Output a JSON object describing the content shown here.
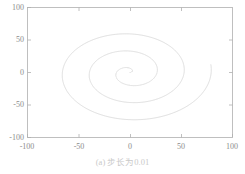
{
  "figure": {
    "caption": "(a) 步长为0.01",
    "background_color": "#ffffff",
    "axis_color": "#b0b0b0",
    "curve_color": "#d2d2d2",
    "tick_label_color": "#8c8c8c",
    "caption_color": "#c9c9c9"
  },
  "chart_data": {
    "type": "line",
    "title": "",
    "subtitle": "",
    "xlabel": "",
    "ylabel": "",
    "xlim": [
      -100,
      100
    ],
    "ylim": [
      -100,
      100
    ],
    "xticks": [
      -100,
      -50,
      0,
      50,
      100
    ],
    "yticks": [
      -100,
      -50,
      0,
      50,
      100
    ],
    "xtick_labels": [
      "-100",
      "-50",
      "0",
      "50",
      "100"
    ],
    "ytick_labels": [
      "-100",
      "-50",
      "0",
      "50",
      "100"
    ],
    "grid": false,
    "legend": null,
    "legend_position": "none",
    "annotations": [
      "(a) 步长为0.01"
    ],
    "series": [
      {
        "name": "spiral",
        "parametric": true,
        "equation": "x = 4.2*t*cos(t), y = 4.2*t*sin(t)",
        "t_range": [
          0,
          19.0
        ],
        "t_step": 0.01,
        "radius_coefficient": 4.2,
        "turns": 3.02,
        "max_radius": 80,
        "x": [
          0.0,
          -1.7,
          -5.3,
          -2.9,
          7.2,
          17.4,
          14.3,
          -4.2,
          -24.6,
          -31.0,
          -16.1,
          12.7,
          38.4,
          45.8,
          29.5,
          -4.2,
          -39.5,
          -56.7,
          -45.7,
          -11.6,
          31.1,
          61.9,
          64.0,
          35.8,
          -10.0,
          -54.9,
          -77.8,
          -68.1,
          -28.6,
          25.9,
          71.0,
          80.0
        ],
        "y": [
          0.0,
          2.6,
          1.4,
          -4.4,
          -7.3,
          -0.3,
          12.4,
          20.9,
          17.1,
          -0.4,
          -22.9,
          -36.7,
          -32.4,
          -9.3,
          21.8,
          45.6,
          46.5,
          23.1,
          -15.2,
          -50.9,
          -62.6,
          -44.5,
          -3.7,
          41.0,
          67.7,
          63.2,
          26.4,
          -24.6,
          -69.0,
          -83.0,
          -59.7,
          -9.2
        ]
      }
    ]
  }
}
